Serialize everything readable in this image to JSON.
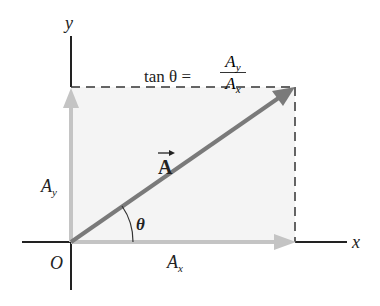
{
  "figure": {
    "labels": {
      "y_axis": "y",
      "x_axis": "x",
      "origin": "O",
      "vector": "A",
      "angle": "θ",
      "ay_main": "A",
      "ay_sub": "y",
      "ax_main": "A",
      "ax_sub": "x"
    },
    "equation": {
      "lhs": "tan θ =",
      "num_main": "A",
      "num_sub": "y",
      "den_main": "A",
      "den_sub": "x"
    },
    "colors": {
      "axis": "#222222",
      "vector": "#7a7a7a",
      "component": "#c4c4c4",
      "fill": "#f4f4f4",
      "dashed": "#333333"
    }
  }
}
